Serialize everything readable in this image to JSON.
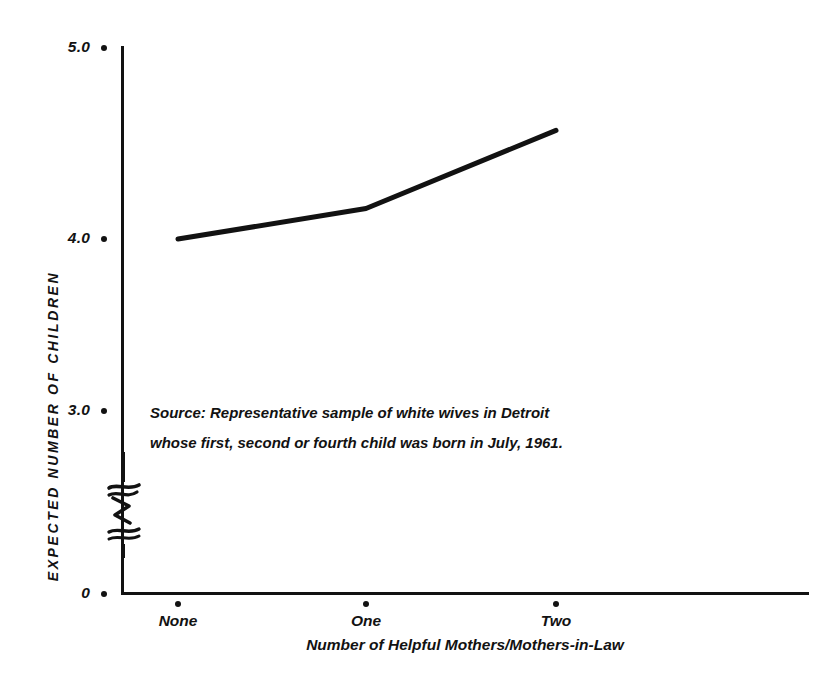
{
  "chart_data": {
    "type": "line",
    "title": "",
    "xlabel": "Number of Helpful Mothers/Mothers-in-Law",
    "ylabel": "EXPECTED NUMBER OF CHILDREN",
    "categories": [
      "None",
      "One",
      "Two"
    ],
    "series": [
      {
        "name": "Expected number of children",
        "values": [
          4.0,
          4.16,
          4.57
        ]
      }
    ],
    "ylim": [
      0,
      5.0
    ],
    "y_ticks": [
      "0",
      "3.0",
      "4.0",
      "5.0"
    ],
    "y_tick_values": [
      0,
      3.0,
      4.0,
      5.0
    ],
    "grid": false,
    "legend": false,
    "axis_break": true,
    "axis_break_note": "hand-drawn zigzag break on y-axis between 0 and 3.0",
    "annotations": [
      "Source: Representative sample of white wives in Detroit",
      "whose first, second or fourth child was born in July, 1961."
    ]
  },
  "axis": {
    "y_title": "EXPECTED NUMBER OF CHILDREN",
    "x_title": "Number of Helpful Mothers/Mothers-in-Law",
    "y_ticks": [
      {
        "label": "5.0"
      },
      {
        "label": "4.0"
      },
      {
        "label": "3.0"
      },
      {
        "label": "0"
      }
    ],
    "x_ticks": [
      {
        "label": "None"
      },
      {
        "label": "One"
      },
      {
        "label": "Two"
      }
    ]
  },
  "source": {
    "line1": "Source: Representative sample of white wives in Detroit",
    "line2": "whose first, second or fourth child was born in July, 1961."
  },
  "colors": {
    "ink": "#121212",
    "background": "#ffffff"
  }
}
